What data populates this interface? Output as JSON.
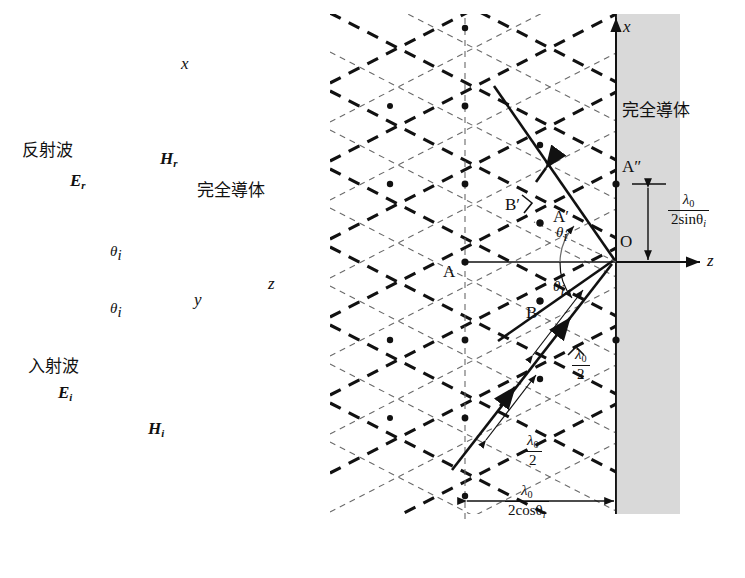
{
  "figure": {
    "background": "#ffffff",
    "ink": "#111111",
    "conductor_fill": "#d8d8d8"
  },
  "left_panel": {
    "axis_x_label": "x",
    "axis_z_label": "z",
    "axis_y_label": "y",
    "conductor_label": "完全導体",
    "reflected_wave_label": "反射波",
    "incident_wave_label": "入射波",
    "field_labels": {
      "E_reflected": "E",
      "E_reflected_sub": "r",
      "H_reflected": "H",
      "H_reflected_sub": "r",
      "E_incident": "E",
      "E_incident_sub": "i",
      "H_incident": "H",
      "H_incident_sub": "i"
    },
    "angle_upper": "θ",
    "angle_upper_sub": "i",
    "angle_lower": "θ",
    "angle_lower_sub": "i"
  },
  "right_panel": {
    "axis_x_label": "x",
    "axis_z_label": "z",
    "conductor_label": "完全導体",
    "points": {
      "A": "A",
      "A_prime": "A′",
      "A_double_prime": "A″",
      "B": "B",
      "B_prime": "B′",
      "O": "O"
    },
    "angle_upper": "θ",
    "angle_upper_sub": "i",
    "angle_lower": "θ",
    "angle_lower_sub": "i",
    "dimension_vertical": {
      "numerator": "λ",
      "numerator_sub": "0",
      "denominator": "2sinθ",
      "denominator_sub": "i"
    },
    "dimension_horizontal": {
      "numerator": "λ",
      "numerator_sub": "0",
      "denominator": "2cosθ",
      "denominator_sub": "i"
    },
    "half_wavelength_upper": {
      "numerator": "λ",
      "numerator_sub": "0",
      "denominator": "2"
    },
    "half_wavelength_lower": {
      "numerator": "λ",
      "numerator_sub": "0",
      "denominator": "2"
    }
  }
}
